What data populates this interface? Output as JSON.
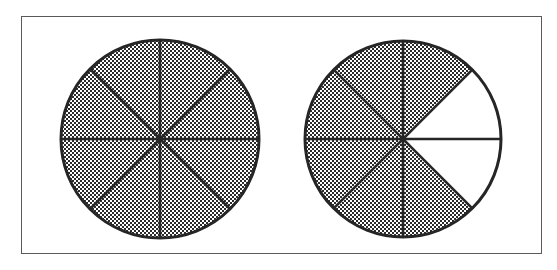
{
  "figure": {
    "background_color": "#ffffff",
    "frame": {
      "label": "figure-border",
      "x": 21,
      "y": 16,
      "width": 521,
      "height": 238,
      "stroke_color": "#5a5a5a",
      "stroke_width": 1
    },
    "shading": {
      "pattern": "checkerboard-dither",
      "cell_size": 2,
      "fill_color": "#2b2b2b",
      "gap_color": "#ffffff",
      "unshaded_color": "#ffffff"
    },
    "stroke": {
      "outline_color": "#262626",
      "outline_width": 3,
      "divider_color": "#262626",
      "divider_width": 2.6
    }
  },
  "chart_data": {
    "type": "pie",
    "xlabel": "",
    "ylabel": "",
    "legend": "none",
    "grid": false,
    "charts": [
      {
        "name": "left-circle",
        "label": "Whole circle fully shaded",
        "fraction": "8/8",
        "numerator": 8,
        "denominator": 8,
        "percent_shaded": 100,
        "center_x": 160,
        "center_y": 139,
        "radius": 99,
        "sector_count": 8,
        "sector_angle_degrees": 45,
        "start_angle_degrees": -90,
        "sectors": [
          {
            "index": 0,
            "start": -90,
            "end": -45,
            "shaded": true
          },
          {
            "index": 1,
            "start": -45,
            "end": 0,
            "shaded": true
          },
          {
            "index": 2,
            "start": 0,
            "end": 45,
            "shaded": true
          },
          {
            "index": 3,
            "start": 45,
            "end": 90,
            "shaded": true
          },
          {
            "index": 4,
            "start": 90,
            "end": 135,
            "shaded": true
          },
          {
            "index": 5,
            "start": 135,
            "end": 180,
            "shaded": true
          },
          {
            "index": 6,
            "start": 180,
            "end": 225,
            "shaded": true
          },
          {
            "index": 7,
            "start": 225,
            "end": 270,
            "shaded": true
          }
        ]
      },
      {
        "name": "right-circle",
        "label": "Circle with six of eight sectors shaded",
        "fraction": "6/8",
        "numerator": 6,
        "denominator": 8,
        "percent_shaded": 75,
        "center_x": 403,
        "center_y": 139,
        "radius": 98,
        "sector_count": 8,
        "sector_angle_degrees": 45,
        "start_angle_degrees": -90,
        "sectors": [
          {
            "index": 0,
            "start": -90,
            "end": -45,
            "shaded": true
          },
          {
            "index": 1,
            "start": -45,
            "end": 0,
            "shaded": false
          },
          {
            "index": 2,
            "start": 0,
            "end": 45,
            "shaded": false
          },
          {
            "index": 3,
            "start": 45,
            "end": 90,
            "shaded": true
          },
          {
            "index": 4,
            "start": 90,
            "end": 135,
            "shaded": true
          },
          {
            "index": 5,
            "start": 135,
            "end": 180,
            "shaded": true
          },
          {
            "index": 6,
            "start": 180,
            "end": 225,
            "shaded": true
          },
          {
            "index": 7,
            "start": 225,
            "end": 270,
            "shaded": true
          }
        ]
      }
    ]
  }
}
